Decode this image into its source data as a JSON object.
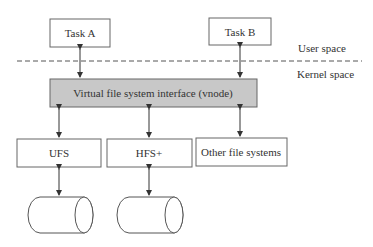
{
  "diagram": {
    "title": "",
    "nodes": [
      {
        "id": "task_a",
        "label": "Task A",
        "x": 50,
        "y": 19,
        "w": 60,
        "h": 28
      },
      {
        "id": "task_b",
        "label": "Task B",
        "x": 209,
        "y": 18,
        "w": 62,
        "h": 27
      },
      {
        "id": "vfs",
        "label": "Virtual file system interface (vnode)",
        "x": 50,
        "y": 79,
        "w": 207,
        "h": 28,
        "fill": "#c8c8c8"
      },
      {
        "id": "ufs",
        "label": "UFS",
        "x": 17,
        "y": 139,
        "w": 84,
        "h": 28
      },
      {
        "id": "hfs",
        "label": "HFS+",
        "x": 107,
        "y": 139,
        "w": 85,
        "h": 28
      },
      {
        "id": "other",
        "label": "Other file systems",
        "x": 196,
        "y": 138,
        "w": 91,
        "h": 28
      },
      {
        "id": "disk1",
        "label": "",
        "shape": "cylinder"
      },
      {
        "id": "disk2",
        "label": "",
        "shape": "cylinder"
      }
    ],
    "edges": [
      {
        "from": "task_a",
        "to": "vfs",
        "bidirectional": true
      },
      {
        "from": "task_b",
        "to": "vfs",
        "bidirectional": true
      },
      {
        "from": "vfs",
        "to": "ufs",
        "bidirectional": true
      },
      {
        "from": "vfs",
        "to": "hfs",
        "bidirectional": true
      },
      {
        "from": "vfs",
        "to": "other",
        "bidirectional": true
      },
      {
        "from": "ufs",
        "to": "disk1",
        "bidirectional": true
      },
      {
        "from": "hfs",
        "to": "disk2",
        "bidirectional": true
      }
    ],
    "regions": {
      "user_space": "User space",
      "kernel_space": "Kernel space"
    }
  }
}
